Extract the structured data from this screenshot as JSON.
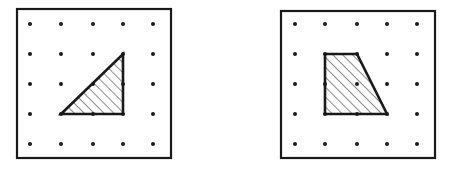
{
  "figures": [
    {
      "name": "triangle-geoboard",
      "frame": {
        "x": 17,
        "y": 9,
        "w": 154,
        "h": 149
      },
      "grid_x": [
        30,
        61,
        93,
        123,
        153
      ],
      "grid_y": [
        24,
        54,
        84,
        114,
        144
      ],
      "shape": "right-triangle",
      "vertices": [
        [
          61,
          114
        ],
        [
          123,
          54
        ],
        [
          123,
          114
        ]
      ]
    },
    {
      "name": "trapezoid-geoboard",
      "frame": {
        "x": 281,
        "y": 11,
        "w": 154,
        "h": 147
      },
      "grid_x": [
        295,
        325,
        357,
        387,
        417
      ],
      "grid_y": [
        24,
        54,
        84,
        114,
        144
      ],
      "shape": "trapezoid",
      "vertices": [
        [
          325,
          54
        ],
        [
          357,
          54
        ],
        [
          387,
          114
        ],
        [
          325,
          114
        ]
      ]
    }
  ],
  "colors": {
    "ink": "#1a1a1a",
    "background": "#ffffff"
  }
}
